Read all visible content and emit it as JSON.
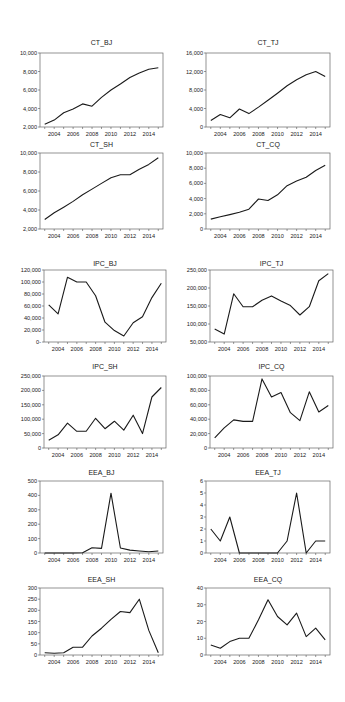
{
  "figure": {
    "years": [
      2003,
      2004,
      2005,
      2006,
      2007,
      2008,
      2009,
      2010,
      2011,
      2012,
      2013,
      2014,
      2015
    ],
    "xtick_labels": [
      "2004",
      "2006",
      "2008",
      "2010",
      "2012",
      "2014"
    ]
  },
  "chart_data": [
    {
      "type": "line",
      "title": "CT_BJ",
      "xlabel": "",
      "ylabel": "",
      "x": [
        2003,
        2004,
        2005,
        2006,
        2007,
        2008,
        2009,
        2010,
        2011,
        2012,
        2013,
        2014,
        2015
      ],
      "values": [
        2300,
        2750,
        3550,
        3950,
        4500,
        4250,
        5200,
        6000,
        6650,
        7350,
        7850,
        8250,
        8400
      ],
      "ylim": [
        2000,
        10000
      ],
      "yticks": [
        2000,
        4000,
        6000,
        8000,
        10000
      ],
      "ytick_labels": [
        "2,000",
        "4,000",
        "6,000",
        "8,000",
        "10,000"
      ],
      "grid": false
    },
    {
      "type": "line",
      "title": "CT_TJ",
      "xlabel": "",
      "ylabel": "",
      "x": [
        2003,
        2004,
        2005,
        2006,
        2007,
        2008,
        2009,
        2010,
        2011,
        2012,
        2013,
        2014,
        2015
      ],
      "values": [
        1400,
        2700,
        2000,
        3900,
        2900,
        4300,
        5800,
        7300,
        8900,
        10200,
        11300,
        12000,
        10900
      ],
      "ylim": [
        0,
        16000
      ],
      "yticks": [
        0,
        4000,
        8000,
        12000,
        16000
      ],
      "ytick_labels": [
        "0",
        "4,000",
        "8,000",
        "12,000",
        "16,000"
      ],
      "grid": false
    },
    {
      "type": "line",
      "title": "CT_SH",
      "xlabel": "",
      "ylabel": "",
      "x": [
        2003,
        2004,
        2005,
        2006,
        2007,
        2008,
        2009,
        2010,
        2011,
        2012,
        2013,
        2014,
        2015
      ],
      "values": [
        3000,
        3700,
        4300,
        4900,
        5600,
        6200,
        6800,
        7400,
        7700,
        7700,
        8300,
        8800,
        9500
      ],
      "ylim": [
        2000,
        10000
      ],
      "yticks": [
        2000,
        4000,
        6000,
        8000,
        10000
      ],
      "ytick_labels": [
        "2,000",
        "4,000",
        "6,000",
        "8,000",
        "10,000"
      ],
      "grid": false
    },
    {
      "type": "line",
      "title": "CT_CQ",
      "xlabel": "",
      "ylabel": "",
      "x": [
        2003,
        2004,
        2005,
        2006,
        2007,
        2008,
        2009,
        2010,
        2011,
        2012,
        2013,
        2014,
        2015
      ],
      "values": [
        1300,
        1600,
        1900,
        2200,
        2600,
        3950,
        3750,
        4500,
        5700,
        6300,
        6800,
        7700,
        8400
      ],
      "ylim": [
        0,
        10000
      ],
      "yticks": [
        0,
        2000,
        4000,
        6000,
        8000,
        10000
      ],
      "ytick_labels": [
        "0",
        "2,000",
        "4,000",
        "6,000",
        "8,000",
        "10,000"
      ],
      "grid": false
    },
    {
      "type": "line",
      "title": "IPC_BJ",
      "xlabel": "",
      "ylabel": "",
      "x": [
        2003,
        2004,
        2005,
        2006,
        2007,
        2008,
        2009,
        2010,
        2011,
        2012,
        2013,
        2014,
        2015
      ],
      "values": [
        62000,
        47000,
        108000,
        100000,
        100000,
        77000,
        33000,
        19000,
        10000,
        32000,
        42000,
        74000,
        98000
      ],
      "ylim": [
        0,
        120000
      ],
      "yticks": [
        0,
        20000,
        40000,
        60000,
        80000,
        100000,
        120000
      ],
      "ytick_labels": [
        "0-",
        "20,000",
        "40,000",
        "60,000",
        "80,000",
        "100,000",
        "120,000"
      ],
      "grid": false
    },
    {
      "type": "line",
      "title": "IPC_TJ",
      "xlabel": "",
      "ylabel": "",
      "x": [
        2003,
        2004,
        2005,
        2006,
        2007,
        2008,
        2009,
        2010,
        2011,
        2012,
        2013,
        2014,
        2015
      ],
      "values": [
        86000,
        72000,
        184000,
        148000,
        148000,
        166000,
        178000,
        164000,
        151000,
        125000,
        148000,
        220000,
        240000
      ],
      "ylim": [
        50000,
        250000
      ],
      "yticks": [
        50000,
        100000,
        150000,
        200000,
        250000
      ],
      "ytick_labels": [
        "50,000",
        "100,000",
        "150,000",
        "200,000",
        "250,000"
      ],
      "grid": false
    },
    {
      "type": "line",
      "title": "IPC_SH",
      "xlabel": "",
      "ylabel": "",
      "x": [
        2003,
        2004,
        2005,
        2006,
        2007,
        2008,
        2009,
        2010,
        2011,
        2012,
        2013,
        2014,
        2015
      ],
      "values": [
        27000,
        46000,
        86000,
        58000,
        58000,
        103000,
        67000,
        93000,
        62000,
        114000,
        50000,
        177000,
        210000
      ],
      "ylim": [
        0,
        250000
      ],
      "yticks": [
        0,
        50000,
        100000,
        150000,
        200000,
        250000
      ],
      "ytick_labels": [
        "0",
        "50,000",
        "100,000",
        "150,000",
        "200,000",
        "250,000"
      ],
      "grid": false
    },
    {
      "type": "line",
      "title": "IPC_CQ",
      "xlabel": "",
      "ylabel": "",
      "x": [
        2003,
        2004,
        2005,
        2006,
        2007,
        2008,
        2009,
        2010,
        2011,
        2012,
        2013,
        2014,
        2015
      ],
      "values": [
        14000,
        28000,
        39000,
        37000,
        37000,
        96000,
        71000,
        77000,
        49000,
        38000,
        78000,
        50000,
        59000
      ],
      "ylim": [
        0,
        100000
      ],
      "yticks": [
        0,
        20000,
        40000,
        60000,
        80000,
        100000
      ],
      "ytick_labels": [
        "0",
        "20,000",
        "40,000",
        "60,000",
        "80,000",
        "100,000"
      ],
      "grid": false
    },
    {
      "type": "line",
      "title": "EEA_BJ",
      "xlabel": "",
      "ylabel": "",
      "x": [
        2003,
        2004,
        2005,
        2006,
        2007,
        2008,
        2009,
        2010,
        2011,
        2012,
        2013,
        2014,
        2015
      ],
      "values": [
        0,
        0,
        0,
        0,
        2,
        36,
        32,
        415,
        35,
        20,
        14,
        8,
        14
      ],
      "ylim": [
        0,
        500
      ],
      "yticks": [
        0,
        100,
        200,
        300,
        400,
        500
      ],
      "ytick_labels": [
        "0",
        "100",
        "200",
        "300",
        "400",
        "500"
      ],
      "grid": false
    },
    {
      "type": "line",
      "title": "EEA_TJ",
      "xlabel": "",
      "ylabel": "",
      "x": [
        2003,
        2004,
        2005,
        2006,
        2007,
        2008,
        2009,
        2010,
        2011,
        2012,
        2013,
        2014,
        2015
      ],
      "values": [
        2,
        1,
        3,
        0,
        0,
        0,
        0,
        0,
        1,
        5,
        0,
        1,
        1
      ],
      "ylim": [
        0,
        6
      ],
      "yticks": [
        0,
        1,
        2,
        3,
        4,
        5,
        6
      ],
      "ytick_labels": [
        "0",
        "1",
        "2",
        "3",
        "4",
        "5",
        "6"
      ],
      "grid": false
    },
    {
      "type": "line",
      "title": "EEA_SH",
      "xlabel": "",
      "ylabel": "",
      "x": [
        2003,
        2004,
        2005,
        2006,
        2007,
        2008,
        2009,
        2010,
        2011,
        2012,
        2013,
        2014,
        2015
      ],
      "values": [
        10,
        8,
        10,
        35,
        35,
        85,
        120,
        160,
        195,
        190,
        250,
        110,
        10
      ],
      "ylim": [
        0,
        300
      ],
      "yticks": [
        0,
        50,
        100,
        150,
        200,
        250,
        300
      ],
      "ytick_labels": [
        "0",
        "50",
        "100",
        "150",
        "200",
        "250",
        "300"
      ],
      "grid": false
    },
    {
      "type": "line",
      "title": "EEA_CQ",
      "xlabel": "",
      "ylabel": "",
      "x": [
        2003,
        2004,
        2005,
        2006,
        2007,
        2008,
        2009,
        2010,
        2011,
        2012,
        2013,
        2014,
        2015
      ],
      "values": [
        6,
        4,
        8,
        10,
        10,
        21,
        33,
        23,
        18,
        25,
        11,
        16,
        9
      ],
      "ylim": [
        0,
        40
      ],
      "yticks": [
        0,
        10,
        20,
        30,
        40
      ],
      "ytick_labels": [
        "0",
        "10",
        "20",
        "30",
        "40"
      ],
      "grid": false
    }
  ],
  "layout": [
    {
      "x0": 40,
      "x1": 163,
      "y0": 53,
      "y1": 127,
      "title_y": 45
    },
    {
      "x0": 206,
      "x1": 330,
      "y0": 53,
      "y1": 127,
      "title_y": 45
    },
    {
      "x0": 40,
      "x1": 163,
      "y0": 153,
      "y1": 229,
      "title_y": 147
    },
    {
      "x0": 206,
      "x1": 330,
      "y0": 153,
      "y1": 229,
      "title_y": 147
    },
    {
      "x0": 44,
      "x1": 166,
      "y0": 270,
      "y1": 342,
      "title_y": 266
    },
    {
      "x0": 210,
      "x1": 333,
      "y0": 270,
      "y1": 342,
      "title_y": 266
    },
    {
      "x0": 44,
      "x1": 166,
      "y0": 376,
      "y1": 448,
      "title_y": 369
    },
    {
      "x0": 210,
      "x1": 333,
      "y0": 376,
      "y1": 448,
      "title_y": 369
    },
    {
      "x0": 40,
      "x1": 163,
      "y0": 481,
      "y1": 553,
      "title_y": 475
    },
    {
      "x0": 206,
      "x1": 330,
      "y0": 481,
      "y1": 553,
      "title_y": 475
    },
    {
      "x0": 40,
      "x1": 163,
      "y0": 588,
      "y1": 655,
      "title_y": 582
    },
    {
      "x0": 206,
      "x1": 330,
      "y0": 588,
      "y1": 655,
      "title_y": 582
    }
  ]
}
